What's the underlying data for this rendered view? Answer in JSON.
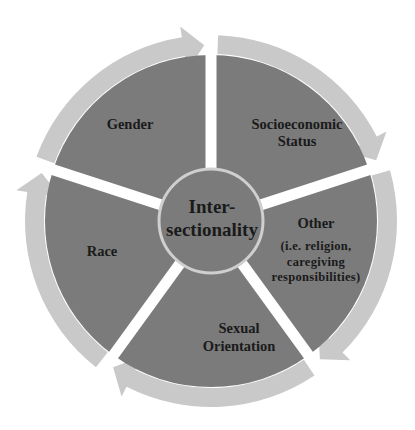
{
  "diagram": {
    "center": {
      "lines": [
        "Inter-",
        "sectionality"
      ]
    },
    "segments": [
      {
        "id": "gender",
        "lines": [
          "Gender"
        ],
        "sub": []
      },
      {
        "id": "socioeconomic-status",
        "lines": [
          "Socioeconomic",
          "Status"
        ],
        "sub": []
      },
      {
        "id": "other",
        "lines": [
          "Other"
        ],
        "sub": [
          "(i.e. religion,",
          "caregiving",
          "responsibilities)"
        ]
      },
      {
        "id": "sexual-orientation",
        "lines": [
          "Sexual",
          "Orientation"
        ],
        "sub": []
      },
      {
        "id": "race",
        "lines": [
          "Race"
        ],
        "sub": []
      }
    ],
    "colors": {
      "segment_fill": "#7b7b7b",
      "ring_arrow": "#c9c9c9",
      "center_stroke": "#cfcfcf",
      "text": "#1a1a1a",
      "background": "#ffffff"
    }
  }
}
